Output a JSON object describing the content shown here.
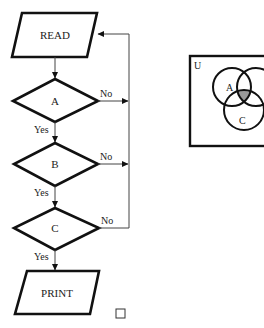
{
  "flowchart": {
    "start": {
      "label": "READ"
    },
    "decisions": [
      {
        "label": "A",
        "yes_label": "Yes",
        "no_label": "No"
      },
      {
        "label": "B",
        "yes_label": "Yes",
        "no_label": "No"
      },
      {
        "label": "C",
        "yes_label": "Yes",
        "no_label": "No"
      }
    ],
    "end": {
      "label": "PRINT"
    }
  },
  "venn": {
    "universe_label": "U",
    "sets": [
      {
        "label": "A"
      },
      {
        "label": "B"
      },
      {
        "label": "C"
      }
    ],
    "shaded_region": "A ∩ B ∩ C",
    "shade_color": "#9a9a9a"
  },
  "end_marker": "□"
}
